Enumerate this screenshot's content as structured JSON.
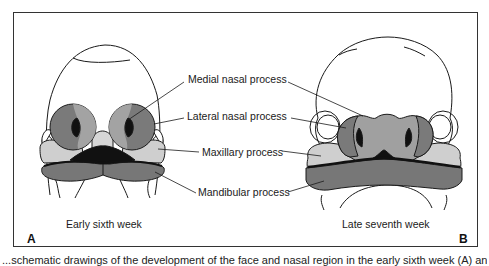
{
  "figure": {
    "labels": {
      "medial_nasal": "Medial nasal process",
      "lateral_nasal": "Lateral nasal process",
      "maxillary": "Maxillary process",
      "mandibular": "Mandibular process"
    },
    "panel_a": {
      "letter": "A",
      "caption": "Early sixth week"
    },
    "panel_b": {
      "letter": "B",
      "caption": "Late seventh week"
    },
    "bottom_caption": "...schematic drawings of the development of the face and nasal region in the early sixth week (A) and in the late..."
  },
  "colors": {
    "outline": "#1a1a1a",
    "medial_nasal": "#9a9a9a",
    "lateral_nasal": "#7a7a7a",
    "maxillary": "#cfcfcf",
    "mandibular": "#777777",
    "dark": "#111111",
    "frame": "#333333"
  }
}
